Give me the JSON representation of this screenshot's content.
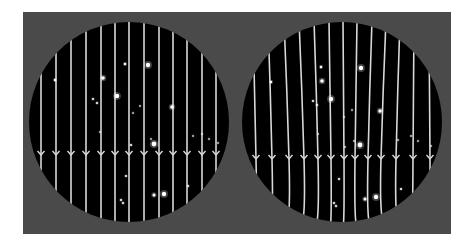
{
  "figure": {
    "background": "#ffffff",
    "panel": {
      "x": 23,
      "y": 12,
      "width": 428,
      "height": 222,
      "color": "#4a4a4a"
    },
    "circle_color": "#000000",
    "line_color": "#d8d8d8",
    "star_color": "#ffffff"
  },
  "panels": [
    {
      "name": "left-sky-undistorted",
      "circle": {
        "cx": 129,
        "cy": 122,
        "r": 100
      },
      "arrow_y": 155,
      "lines": [
        {
          "top": [
            41,
            122
          ],
          "mid": [
            41,
            122
          ],
          "bot": [
            41,
            122
          ],
          "y0": 92,
          "y1": 152
        },
        {
          "top": [
            56,
            60
          ],
          "mid": [
            56,
            122
          ],
          "bot": [
            56,
            190
          ],
          "y0": 75,
          "y1": 170
        },
        {
          "top": [
            71,
            45
          ],
          "mid": [
            71,
            122
          ],
          "bot": [
            71,
            200
          ],
          "y0": 55,
          "y1": 192
        },
        {
          "top": [
            86,
            30
          ],
          "mid": [
            86,
            122
          ],
          "bot": [
            86,
            212
          ],
          "y0": 40,
          "y1": 208
        },
        {
          "top": [
            101,
            25
          ],
          "mid": [
            101,
            122
          ],
          "bot": [
            101,
            218
          ],
          "y0": 28,
          "y1": 217
        },
        {
          "top": [
            115,
            22
          ],
          "mid": [
            115,
            122
          ],
          "bot": [
            115,
            222
          ],
          "y0": 23,
          "y1": 221
        },
        {
          "top": [
            129,
            20
          ],
          "mid": [
            129,
            122
          ],
          "bot": [
            129,
            224
          ],
          "y0": 21,
          "y1": 223
        },
        {
          "top": [
            144,
            22
          ],
          "mid": [
            144,
            122
          ],
          "bot": [
            144,
            222
          ],
          "y0": 23,
          "y1": 221
        },
        {
          "top": [
            159,
            25
          ],
          "mid": [
            159,
            122
          ],
          "bot": [
            159,
            218
          ],
          "y0": 28,
          "y1": 217
        },
        {
          "top": [
            173,
            30
          ],
          "mid": [
            173,
            122
          ],
          "bot": [
            173,
            212
          ],
          "y0": 33,
          "y1": 210
        },
        {
          "top": [
            187,
            40
          ],
          "mid": [
            187,
            122
          ],
          "bot": [
            187,
            205
          ],
          "y0": 40,
          "y1": 203
        },
        {
          "top": [
            202,
            55
          ],
          "mid": [
            202,
            122
          ],
          "bot": [
            202,
            190
          ],
          "y0": 55,
          "y1": 190
        },
        {
          "top": [
            216,
            75
          ],
          "mid": [
            216,
            122
          ],
          "bot": [
            216,
            170
          ],
          "y0": 75,
          "y1": 170
        }
      ],
      "stars": [
        {
          "x": 55,
          "y": 80,
          "r": 1.2
        },
        {
          "x": 103,
          "y": 78,
          "r": 1.8
        },
        {
          "x": 125,
          "y": 64,
          "r": 1.2
        },
        {
          "x": 148,
          "y": 65,
          "r": 2.2
        },
        {
          "x": 117,
          "y": 96,
          "r": 2.2
        },
        {
          "x": 93,
          "y": 99,
          "r": 1.0
        },
        {
          "x": 97,
          "y": 103,
          "r": 1.0
        },
        {
          "x": 140,
          "y": 106,
          "r": 0.8
        },
        {
          "x": 133,
          "y": 113,
          "r": 0.8
        },
        {
          "x": 172,
          "y": 107,
          "r": 1.8
        },
        {
          "x": 100,
          "y": 132,
          "r": 0.8
        },
        {
          "x": 131,
          "y": 145,
          "r": 1.0
        },
        {
          "x": 151,
          "y": 139,
          "r": 0.8
        },
        {
          "x": 154,
          "y": 144,
          "r": 2.4
        },
        {
          "x": 193,
          "y": 136,
          "r": 0.8
        },
        {
          "x": 202,
          "y": 134,
          "r": 0.8
        },
        {
          "x": 209,
          "y": 139,
          "r": 0.8
        },
        {
          "x": 218,
          "y": 143,
          "r": 0.8
        },
        {
          "x": 126,
          "y": 176,
          "r": 1.0
        },
        {
          "x": 164,
          "y": 194,
          "r": 2.2
        },
        {
          "x": 154,
          "y": 195,
          "r": 1.5
        },
        {
          "x": 121,
          "y": 200,
          "r": 1.0
        },
        {
          "x": 123,
          "y": 203,
          "r": 1.0
        },
        {
          "x": 188,
          "y": 186,
          "r": 1.0
        }
      ]
    },
    {
      "name": "right-sky-lensed",
      "circle": {
        "cx": 342,
        "cy": 122,
        "r": 100
      },
      "arrow_y": 159,
      "lines": [
        {
          "top": [
            253,
            80
          ],
          "mid": [
            256,
            159
          ],
          "bot": [
            258,
            175
          ],
          "y0": 76,
          "y1": 172
        },
        {
          "top": [
            268,
            55
          ],
          "mid": [
            272,
            159
          ],
          "bot": [
            270,
            193
          ],
          "y0": 55,
          "y1": 193
        },
        {
          "top": [
            284,
            38
          ],
          "mid": [
            289,
            159
          ],
          "bot": [
            285,
            207
          ],
          "y0": 38,
          "y1": 207
        },
        {
          "top": [
            299,
            30
          ],
          "mid": [
            304,
            159
          ],
          "bot": [
            300,
            215
          ],
          "y0": 30,
          "y1": 215
        },
        {
          "top": [
            314,
            25
          ],
          "mid": [
            318,
            159
          ],
          "bot": [
            315,
            220
          ],
          "y0": 25,
          "y1": 220
        },
        {
          "top": [
            329,
            22
          ],
          "mid": [
            331,
            159
          ],
          "bot": [
            330,
            223
          ],
          "y0": 22,
          "y1": 223
        },
        {
          "top": [
            343,
            20
          ],
          "mid": [
            344,
            159
          ],
          "bot": [
            343,
            224
          ],
          "y0": 20,
          "y1": 224
        },
        {
          "top": [
            357,
            22
          ],
          "mid": [
            355,
            159
          ],
          "bot": [
            357,
            223
          ],
          "y0": 22,
          "y1": 223
        },
        {
          "top": [
            372,
            25
          ],
          "mid": [
            368,
            159
          ],
          "bot": [
            371,
            220
          ],
          "y0": 25,
          "y1": 220
        },
        {
          "top": [
            386,
            30
          ],
          "mid": [
            381,
            159
          ],
          "bot": [
            386,
            215
          ],
          "y0": 30,
          "y1": 215
        },
        {
          "top": [
            400,
            40
          ],
          "mid": [
            396,
            159
          ],
          "bot": [
            400,
            205
          ],
          "y0": 40,
          "y1": 205
        },
        {
          "top": [
            414,
            55
          ],
          "mid": [
            413,
            159
          ],
          "bot": [
            412,
            190
          ],
          "y0": 55,
          "y1": 190
        },
        {
          "top": [
            429,
            80
          ],
          "mid": [
            430,
            159
          ],
          "bot": [
            429,
            172
          ],
          "y0": 76,
          "y1": 172
        }
      ],
      "stars": [
        {
          "x": 271,
          "y": 82,
          "r": 1.2
        },
        {
          "x": 321,
          "y": 67,
          "r": 1.2
        },
        {
          "x": 361,
          "y": 68,
          "r": 2.2
        },
        {
          "x": 322,
          "y": 81,
          "r": 1.8
        },
        {
          "x": 331,
          "y": 99,
          "r": 2.2
        },
        {
          "x": 313,
          "y": 101,
          "r": 1.0
        },
        {
          "x": 317,
          "y": 105,
          "r": 1.0
        },
        {
          "x": 352,
          "y": 110,
          "r": 0.8
        },
        {
          "x": 344,
          "y": 117,
          "r": 0.8
        },
        {
          "x": 380,
          "y": 111,
          "r": 1.8
        },
        {
          "x": 318,
          "y": 134,
          "r": 0.8
        },
        {
          "x": 354,
          "y": 141,
          "r": 0.8
        },
        {
          "x": 360,
          "y": 145,
          "r": 2.4
        },
        {
          "x": 345,
          "y": 147,
          "r": 0.8
        },
        {
          "x": 398,
          "y": 140,
          "r": 0.8
        },
        {
          "x": 411,
          "y": 136,
          "r": 0.8
        },
        {
          "x": 418,
          "y": 141,
          "r": 0.8
        },
        {
          "x": 431,
          "y": 146,
          "r": 0.8
        },
        {
          "x": 339,
          "y": 179,
          "r": 1.0
        },
        {
          "x": 376,
          "y": 197,
          "r": 2.2
        },
        {
          "x": 365,
          "y": 199,
          "r": 1.5
        },
        {
          "x": 334,
          "y": 203,
          "r": 1.0
        },
        {
          "x": 336,
          "y": 206,
          "r": 1.0
        },
        {
          "x": 401,
          "y": 189,
          "r": 1.0
        }
      ]
    }
  ]
}
